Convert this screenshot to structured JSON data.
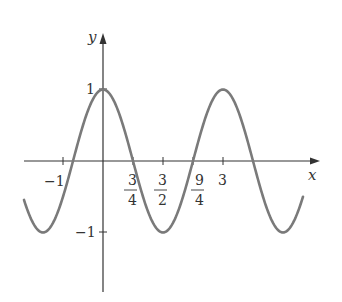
{
  "chart_data": {
    "type": "line",
    "title": "",
    "function": "y = cos(2πx/3)",
    "xlabel": "x",
    "ylabel": "y",
    "xlim": [
      -2,
      5.3
    ],
    "ylim": [
      -2.0,
      1.8
    ],
    "grid": false,
    "legend": null,
    "x_ticks": [
      {
        "value": -1,
        "label": "-1"
      },
      {
        "value": 0.75,
        "label_num": "3",
        "label_den": "4"
      },
      {
        "value": 1.5,
        "label_num": "3",
        "label_den": "2"
      },
      {
        "value": 2.25,
        "label_num": "9",
        "label_den": "4"
      },
      {
        "value": 3,
        "label": "3"
      }
    ],
    "y_ticks": [
      {
        "value": 1,
        "label": "1"
      },
      {
        "value": -1,
        "label": "-1"
      }
    ],
    "series": [
      {
        "name": "cos(2πx/3)",
        "color": "#7a7a7a",
        "x": [
          -1.98,
          -1.5,
          -0.75,
          0,
          0.75,
          1.5,
          2.25,
          3,
          3.75,
          4.5,
          5.0
        ],
        "values": [
          -0.98,
          -1,
          0,
          1,
          0,
          -1,
          0,
          1,
          0,
          -1,
          -0.5
        ]
      }
    ],
    "annotations": {
      "zeros": [
        -0.75,
        0.75,
        2.25,
        3.75
      ],
      "maxima": [
        0,
        3
      ],
      "minima": [
        -1.5,
        1.5,
        4.5
      ]
    }
  },
  "labels": {
    "x_axis": "x",
    "y_axis": "y",
    "tick_neg1_x": "−1",
    "tick_3_4_num": "3",
    "tick_3_4_den": "4",
    "tick_3_2_num": "3",
    "tick_3_2_den": "2",
    "tick_9_4_num": "9",
    "tick_9_4_den": "4",
    "tick_3": "3",
    "tick_1_y": "1",
    "tick_neg1_y": "−1"
  },
  "colors": {
    "axis": "#333333",
    "curve": "#7a7a7a"
  }
}
